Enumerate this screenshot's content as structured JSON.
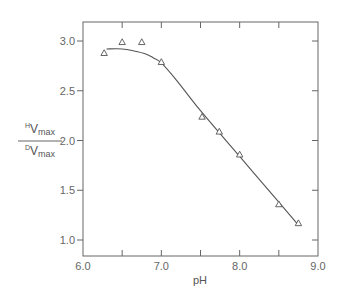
{
  "chart_data": {
    "type": "scatter",
    "title": "",
    "xlabel": "pH",
    "ylabel": {
      "numerator": {
        "sup": "H",
        "main": "V",
        "sub": "max"
      },
      "denominator": {
        "sup": "D",
        "main": "V",
        "sub": "max"
      }
    },
    "xlim": [
      6.0,
      9.0
    ],
    "ylim": [
      0.85,
      3.2
    ],
    "x_ticks": [
      6.0,
      7.0,
      8.0,
      9.0
    ],
    "x_tick_labels": [
      "6.0",
      "7.0",
      "8.0",
      "9.0"
    ],
    "x_minor_ticks": [
      6.5,
      7.5,
      8.5
    ],
    "y_ticks": [
      1.0,
      1.5,
      2.0,
      2.5,
      3.0
    ],
    "y_tick_labels": [
      "1.0",
      "1.5",
      "2.0",
      "2.5",
      "3.0"
    ],
    "grid": false,
    "legend": "none",
    "series": [
      {
        "name": "observed",
        "marker": "triangle-open",
        "points": [
          {
            "x": 6.27,
            "y": 2.88
          },
          {
            "x": 6.5,
            "y": 2.99
          },
          {
            "x": 6.75,
            "y": 2.99
          },
          {
            "x": 7.0,
            "y": 2.79
          },
          {
            "x": 7.52,
            "y": 2.24
          },
          {
            "x": 7.74,
            "y": 2.09
          },
          {
            "x": 8.0,
            "y": 1.86
          },
          {
            "x": 8.5,
            "y": 1.36
          },
          {
            "x": 8.75,
            "y": 1.17
          }
        ]
      },
      {
        "name": "fitted curve",
        "marker": "line",
        "points": [
          {
            "x": 6.3,
            "y": 2.92
          },
          {
            "x": 6.5,
            "y": 2.92
          },
          {
            "x": 6.65,
            "y": 2.9
          },
          {
            "x": 6.8,
            "y": 2.87
          },
          {
            "x": 6.9,
            "y": 2.83
          },
          {
            "x": 7.0,
            "y": 2.78
          },
          {
            "x": 7.2,
            "y": 2.6
          },
          {
            "x": 7.5,
            "y": 2.3
          },
          {
            "x": 8.0,
            "y": 1.84
          },
          {
            "x": 8.5,
            "y": 1.38
          },
          {
            "x": 8.75,
            "y": 1.15
          }
        ]
      }
    ]
  }
}
